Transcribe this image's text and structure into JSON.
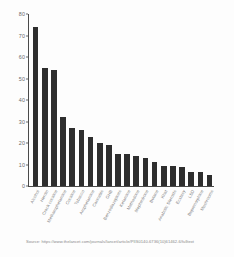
{
  "chart_data": {
    "type": "bar",
    "title": "",
    "xlabel": "",
    "ylabel": "",
    "ylim": [
      0,
      80
    ],
    "yticks": [
      0,
      10,
      20,
      30,
      40,
      50,
      60,
      70,
      80
    ],
    "grid": false,
    "legend": null,
    "bar_color": "#2e2e2e",
    "categories": [
      "Alcohol",
      "Heroin",
      "Crack cocaine",
      "Methamphetamine",
      "Cocaine",
      "Tobacco",
      "Amphetamine",
      "Cannabis",
      "GHB",
      "Benzodiazepines",
      "Ketamine",
      "Methadone",
      "Mephedrone",
      "Butane",
      "Khat",
      "Anabolic Steroids",
      "Ecstasy",
      "LSD",
      "Buprenorphine",
      "Mushrooms"
    ],
    "values": [
      74,
      55,
      54,
      32,
      27,
      26,
      23,
      20,
      19,
      15,
      15,
      14,
      13,
      11,
      9.5,
      9.5,
      9,
      6.5,
      6.5,
      5
    ]
  },
  "source": {
    "text": "Source: https://www.thelancet.com/journals/lancet/article/PIIS0140-6736(10)61462-6/fulltext"
  },
  "colors": {
    "bar": "#2e2e2e",
    "axis": "#4a4a4a",
    "tick_text": "#6a6a6a",
    "label_text": "#7d7d7d",
    "source_text": "#8a8a8a",
    "background": "#fdfdfd"
  }
}
